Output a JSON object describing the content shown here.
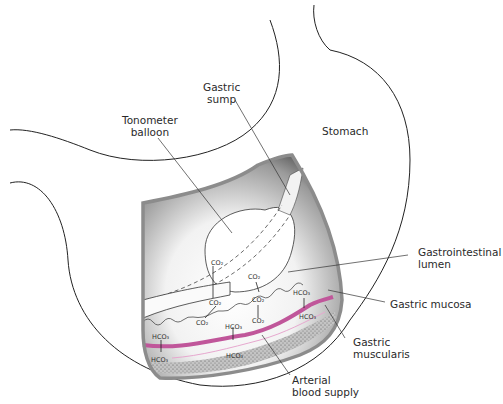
{
  "figure": {
    "labels": {
      "gastric_sump": [
        "Gastric",
        "sump"
      ],
      "tonometer_balloon": [
        "Tonometer",
        "balloon"
      ],
      "stomach": "Stomach",
      "gi_lumen": [
        "Gastrointestinal",
        "lumen"
      ],
      "gastric_mucosa": "Gastric mucosa",
      "gastric_muscularis": [
        "Gastric",
        "muscularis"
      ],
      "arterial_blood": [
        "Arterial",
        "blood supply"
      ]
    },
    "chemicals": {
      "co2": "CO₂",
      "hco3": "HCO₃"
    },
    "colors": {
      "artery": "#c0569a",
      "artery_light": "#e7a8cf",
      "wall": "#8c8c8c",
      "muscularis": "#b9b9b9",
      "outline": "#222222"
    }
  }
}
